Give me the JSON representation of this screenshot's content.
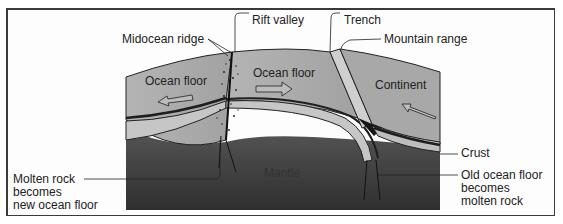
{
  "diagram": {
    "type": "plate-tectonics-cross-section",
    "labels": {
      "rift_valley": "Rift valley",
      "midocean_ridge": "Midocean ridge",
      "trench": "Trench",
      "mountain_range": "Mountain range",
      "ocean_floor_left": "Ocean floor",
      "ocean_floor_right": "Ocean floor",
      "continent": "Continent",
      "crust": "Crust",
      "mantle": "Mantle",
      "molten_rock": [
        "Molten rock",
        "becomes",
        "new ocean floor"
      ],
      "old_ocean_floor": [
        "Old ocean floor",
        "becomes",
        "molten rock"
      ]
    },
    "arrows": [
      {
        "name": "ocean-floor-left-arrow",
        "direction": "left"
      },
      {
        "name": "ocean-floor-right-arrow",
        "direction": "right"
      },
      {
        "name": "continent-arrow",
        "direction": "left"
      }
    ],
    "colors": {
      "surface": "#a9a9a9",
      "crust_band": "#c4c4c4",
      "mantle": "#3e3e3e",
      "outline": "#222222",
      "frame": "#3a3a3a"
    }
  }
}
